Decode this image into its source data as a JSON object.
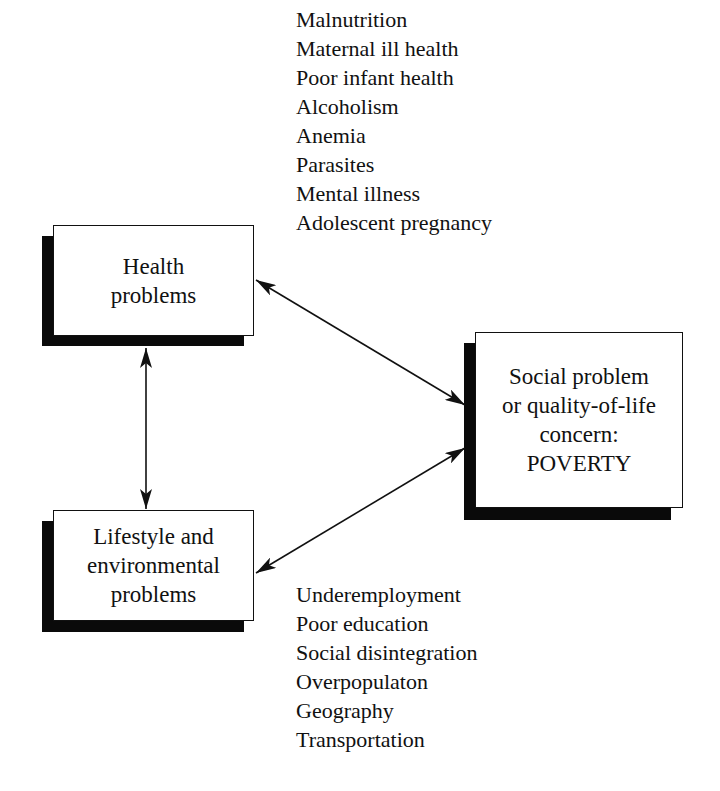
{
  "diagram": {
    "type": "relationship-diagram",
    "health_box": {
      "lines": [
        "Health",
        "problems"
      ]
    },
    "lifestyle_box": {
      "lines": [
        "Lifestyle and",
        "environmental",
        "problems"
      ]
    },
    "poverty_box": {
      "lines": [
        "Social problem",
        "or quality-of-life",
        "concern:",
        "POVERTY"
      ]
    },
    "health_factors": [
      "Malnutrition",
      "Maternal ill health",
      "Poor infant health",
      "Alcoholism",
      "Anemia",
      "Parasites",
      "Mental illness",
      "Adolescent pregnancy"
    ],
    "lifestyle_factors": [
      "Underemployment",
      "Poor education",
      "Social disintegration",
      "Overpopulaton",
      "Geography",
      "Transportation"
    ],
    "connections": [
      {
        "from": "Health problems",
        "to": "Social problem or quality-of-life concern: POVERTY",
        "direction": "bidirectional"
      },
      {
        "from": "Lifestyle and environmental problems",
        "to": "Social problem or quality-of-life concern: POVERTY",
        "direction": "bidirectional"
      },
      {
        "from": "Health problems",
        "to": "Lifestyle and environmental problems",
        "direction": "bidirectional"
      }
    ],
    "colors": {
      "line": "#111111",
      "shadow": "#0a0a0a",
      "background": "#ffffff"
    }
  }
}
